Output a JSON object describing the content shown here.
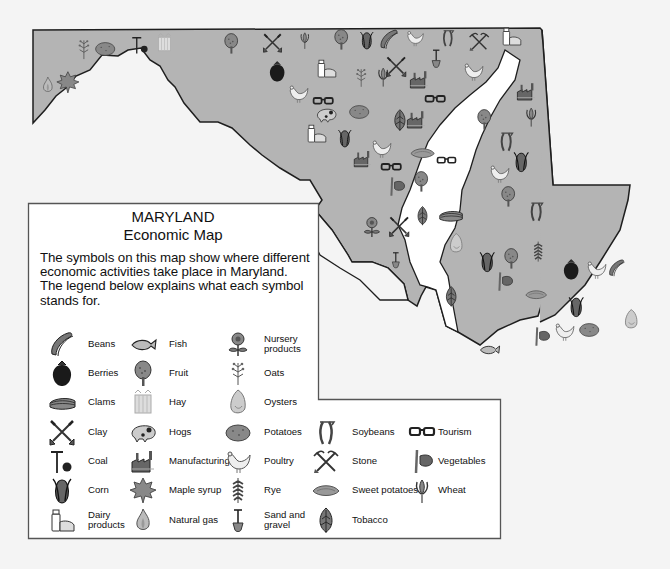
{
  "map": {
    "title": "MARYLAND",
    "subtitle": "Economic Map",
    "fill_color": "#b4b4b4",
    "water_color": "#ffffff",
    "outline_color": "#1e1e1e"
  },
  "legend": {
    "description": "The symbols on this map show where different economic activities take place in Maryland. The legend below explains what each symbol stands for.",
    "items": [
      {
        "label": "Beans",
        "icon": "beans-icon"
      },
      {
        "label": "Berries",
        "icon": "berries-icon"
      },
      {
        "label": "Clams",
        "icon": "clams-icon"
      },
      {
        "label": "Clay",
        "icon": "clay-icon"
      },
      {
        "label": "Coal",
        "icon": "coal-icon"
      },
      {
        "label": "Corn",
        "icon": "corn-icon"
      },
      {
        "label": "Dairy products",
        "icon": "dairy-icon"
      },
      {
        "label": "Fish",
        "icon": "fish-icon"
      },
      {
        "label": "Fruit",
        "icon": "fruit-tree-icon"
      },
      {
        "label": "Hay",
        "icon": "hay-icon"
      },
      {
        "label": "Hogs",
        "icon": "hog-icon"
      },
      {
        "label": "Manufacturing",
        "icon": "factory-icon"
      },
      {
        "label": "Maple syrup",
        "icon": "maple-leaf-icon"
      },
      {
        "label": "Natural gas",
        "icon": "flame-icon"
      },
      {
        "label": "Nursery products",
        "icon": "flower-icon"
      },
      {
        "label": "Oats",
        "icon": "oats-icon"
      },
      {
        "label": "Oysters",
        "icon": "oyster-icon"
      },
      {
        "label": "Potatoes",
        "icon": "potato-icon"
      },
      {
        "label": "Poultry",
        "icon": "chicken-icon"
      },
      {
        "label": "Rye",
        "icon": "rye-icon"
      },
      {
        "label": "Sand and gravel",
        "icon": "shovel-icon"
      },
      {
        "label": "Soybeans",
        "icon": "soybean-icon"
      },
      {
        "label": "Stone",
        "icon": "pick-shovel-icon"
      },
      {
        "label": "Sweet potatoes",
        "icon": "sweet-potato-icon"
      },
      {
        "label": "Tobacco",
        "icon": "tobacco-leaf-icon"
      },
      {
        "label": "Tourism",
        "icon": "sunglasses-icon"
      },
      {
        "label": "Vegetables",
        "icon": "vegetables-icon"
      },
      {
        "label": "Wheat",
        "icon": "wheat-icon"
      }
    ]
  }
}
